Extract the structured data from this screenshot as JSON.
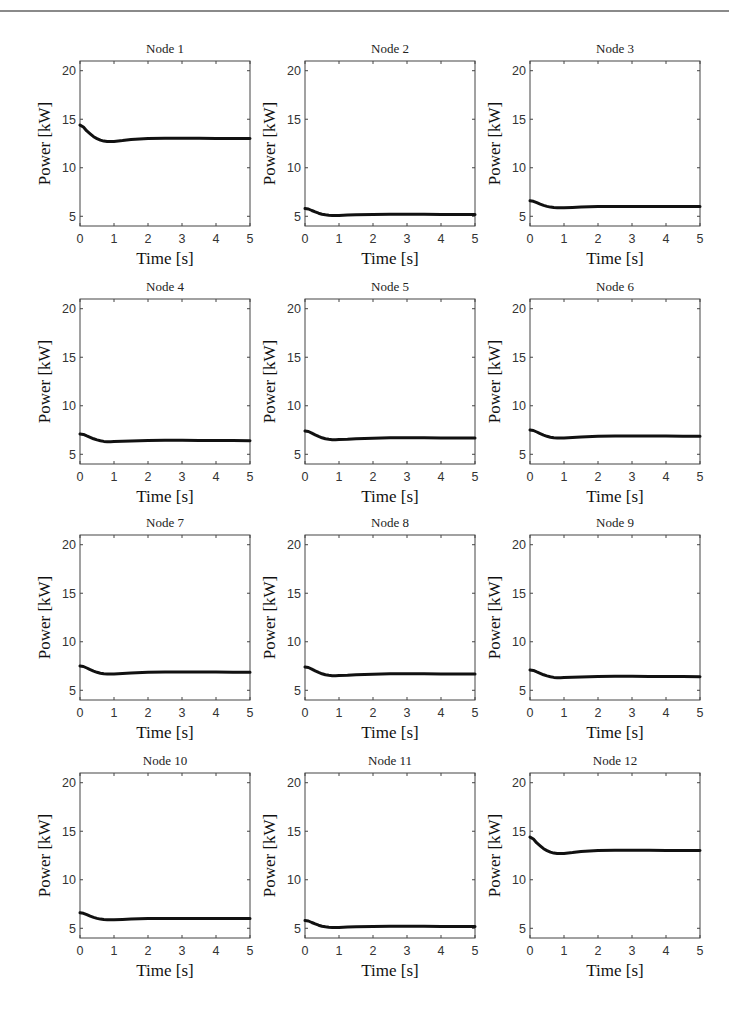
{
  "page": {
    "header_rule": true
  },
  "chart_data": {
    "type": "line",
    "layout": {
      "rows": 4,
      "cols": 3,
      "grid": false,
      "legend": "none"
    },
    "shared": {
      "xlabel": "Time [s]",
      "ylabel": "Power [kW]",
      "xlim": [
        0,
        5
      ],
      "ylim": [
        4,
        21
      ],
      "xticks": [
        0,
        1,
        2,
        3,
        4,
        5
      ],
      "yticks": [
        5,
        10,
        15,
        20
      ],
      "line_color": "#111111"
    },
    "x": [
      0,
      0.1,
      0.2,
      0.3,
      0.4,
      0.5,
      0.6,
      0.7,
      0.8,
      0.9,
      1.0,
      1.25,
      1.5,
      2.0,
      2.5,
      3.0,
      3.5,
      4.0,
      4.5,
      5.0
    ],
    "subplots": [
      {
        "title": "Node 1",
        "values": [
          14.4,
          14.2,
          13.8,
          13.5,
          13.2,
          13.0,
          12.85,
          12.75,
          12.7,
          12.7,
          12.72,
          12.8,
          12.9,
          13.0,
          13.05,
          13.05,
          13.05,
          13.03,
          13.02,
          13.0
        ]
      },
      {
        "title": "Node 2",
        "values": [
          5.8,
          5.75,
          5.6,
          5.45,
          5.32,
          5.22,
          5.15,
          5.1,
          5.08,
          5.08,
          5.09,
          5.12,
          5.15,
          5.2,
          5.22,
          5.22,
          5.21,
          5.2,
          5.2,
          5.2
        ]
      },
      {
        "title": "Node 3",
        "values": [
          6.6,
          6.55,
          6.4,
          6.25,
          6.12,
          6.02,
          5.95,
          5.9,
          5.88,
          5.88,
          5.89,
          5.92,
          5.95,
          6.0,
          6.02,
          6.02,
          6.01,
          6.0,
          6.0,
          6.0
        ]
      },
      {
        "title": "Node 4",
        "values": [
          7.1,
          7.05,
          6.9,
          6.75,
          6.6,
          6.48,
          6.4,
          6.33,
          6.3,
          6.3,
          6.31,
          6.34,
          6.37,
          6.42,
          6.44,
          6.44,
          6.43,
          6.42,
          6.41,
          6.4
        ]
      },
      {
        "title": "Node 5",
        "values": [
          7.4,
          7.35,
          7.18,
          7.0,
          6.84,
          6.7,
          6.6,
          6.54,
          6.5,
          6.5,
          6.51,
          6.55,
          6.6,
          6.66,
          6.7,
          6.7,
          6.7,
          6.69,
          6.68,
          6.68
        ]
      },
      {
        "title": "Node 6",
        "values": [
          7.5,
          7.45,
          7.3,
          7.12,
          6.98,
          6.85,
          6.76,
          6.7,
          6.68,
          6.68,
          6.69,
          6.73,
          6.78,
          6.85,
          6.88,
          6.88,
          6.88,
          6.87,
          6.86,
          6.86
        ]
      },
      {
        "title": "Node 7",
        "values": [
          7.5,
          7.45,
          7.3,
          7.12,
          6.98,
          6.85,
          6.76,
          6.7,
          6.68,
          6.68,
          6.69,
          6.73,
          6.78,
          6.85,
          6.88,
          6.88,
          6.88,
          6.87,
          6.86,
          6.86
        ]
      },
      {
        "title": "Node 8",
        "values": [
          7.4,
          7.35,
          7.18,
          7.0,
          6.84,
          6.7,
          6.6,
          6.54,
          6.5,
          6.5,
          6.51,
          6.55,
          6.6,
          6.66,
          6.7,
          6.7,
          6.7,
          6.69,
          6.68,
          6.68
        ]
      },
      {
        "title": "Node 9",
        "values": [
          7.1,
          7.05,
          6.9,
          6.75,
          6.6,
          6.48,
          6.4,
          6.33,
          6.3,
          6.3,
          6.31,
          6.34,
          6.37,
          6.42,
          6.44,
          6.44,
          6.43,
          6.42,
          6.41,
          6.4
        ]
      },
      {
        "title": "Node 10",
        "values": [
          6.6,
          6.55,
          6.4,
          6.25,
          6.12,
          6.02,
          5.95,
          5.9,
          5.88,
          5.88,
          5.89,
          5.92,
          5.95,
          6.0,
          6.02,
          6.02,
          6.01,
          6.0,
          6.0,
          6.0
        ]
      },
      {
        "title": "Node 11",
        "values": [
          5.8,
          5.75,
          5.6,
          5.45,
          5.32,
          5.22,
          5.15,
          5.1,
          5.08,
          5.08,
          5.09,
          5.12,
          5.15,
          5.2,
          5.22,
          5.22,
          5.21,
          5.2,
          5.2,
          5.2
        ]
      },
      {
        "title": "Node 12",
        "values": [
          14.4,
          14.2,
          13.8,
          13.5,
          13.2,
          13.0,
          12.85,
          12.75,
          12.7,
          12.7,
          12.72,
          12.8,
          12.9,
          13.0,
          13.05,
          13.05,
          13.05,
          13.03,
          13.02,
          13.0
        ]
      }
    ]
  }
}
